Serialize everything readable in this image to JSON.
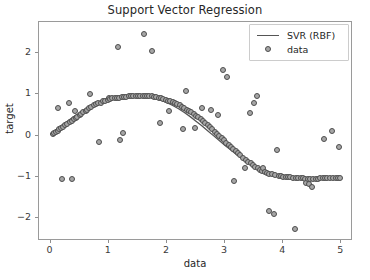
{
  "chart_data": {
    "type": "scatter",
    "title": "Support Vector Regression",
    "xlabel": "data",
    "ylabel": "target",
    "xlim": [
      -0.2,
      5.2
    ],
    "ylim": [
      -2.55,
      2.75
    ],
    "xticks": [
      0,
      1,
      2,
      3,
      4,
      5
    ],
    "yticks": [
      -2,
      -1,
      0,
      1,
      2
    ],
    "xtick_labels": [
      "0",
      "1",
      "2",
      "3",
      "4",
      "5"
    ],
    "ytick_labels": [
      "−2",
      "−1",
      "0",
      "1",
      "2"
    ],
    "grid": false,
    "legend_position": "upper right",
    "legend": [
      {
        "label": "SVR (RBF)",
        "key": "line",
        "color": "#555555"
      },
      {
        "label": "data",
        "key": "marker",
        "color": "#a6a6a6"
      }
    ],
    "series": [
      {
        "name": "SVR (RBF)",
        "type": "line",
        "color": "#555555",
        "comment": "smooth regression curve approximating sin(x) over [0,5]",
        "x": [
          0.0,
          0.1,
          0.2,
          0.3,
          0.4,
          0.5,
          0.6,
          0.7,
          0.8,
          0.9,
          1.0,
          1.1,
          1.2,
          1.3,
          1.4,
          1.5,
          1.6,
          1.7,
          1.8,
          1.9,
          2.0,
          2.1,
          2.2,
          2.3,
          2.4,
          2.5,
          2.6,
          2.7,
          2.8,
          2.9,
          3.0,
          3.1,
          3.2,
          3.3,
          3.4,
          3.5,
          3.6,
          3.7,
          3.8,
          3.9,
          4.0,
          4.1,
          4.2,
          4.3,
          4.4,
          4.5,
          4.6,
          4.7,
          4.8,
          4.9,
          5.0
        ],
        "y": [
          0.04,
          0.15,
          0.26,
          0.36,
          0.46,
          0.55,
          0.64,
          0.72,
          0.79,
          0.85,
          0.89,
          0.93,
          0.95,
          0.97,
          0.97,
          0.97,
          0.96,
          0.94,
          0.9,
          0.86,
          0.8,
          0.73,
          0.65,
          0.56,
          0.46,
          0.35,
          0.24,
          0.12,
          0.0,
          -0.12,
          -0.24,
          -0.35,
          -0.46,
          -0.56,
          -0.65,
          -0.73,
          -0.8,
          -0.86,
          -0.9,
          -0.94,
          -0.96,
          -0.98,
          -0.99,
          -1.0,
          -1.01,
          -1.02,
          -1.02,
          -1.02,
          -1.02,
          -1.02,
          -1.02
        ]
      },
      {
        "name": "data",
        "type": "scatter",
        "marker": "circle",
        "facecolor": "#a6a6a6",
        "edgecolor": "#4d4d4d",
        "points": [
          [
            0.04,
            0.04
          ],
          [
            0.06,
            0.06
          ],
          [
            0.09,
            0.09
          ],
          [
            0.12,
            0.12
          ],
          [
            0.15,
            0.15
          ],
          [
            0.18,
            0.18
          ],
          [
            0.2,
            -1.05
          ],
          [
            0.22,
            0.22
          ],
          [
            0.25,
            0.25
          ],
          [
            0.28,
            0.28
          ],
          [
            0.12,
            0.67
          ],
          [
            0.32,
            0.78
          ],
          [
            0.33,
            0.33
          ],
          [
            0.36,
            0.36
          ],
          [
            0.37,
            -1.04
          ],
          [
            0.4,
            0.4
          ],
          [
            0.42,
            0.6
          ],
          [
            0.43,
            0.43
          ],
          [
            0.46,
            0.46
          ],
          [
            0.5,
            0.5
          ],
          [
            0.53,
            0.53
          ],
          [
            0.56,
            0.56
          ],
          [
            0.6,
            0.6
          ],
          [
            0.63,
            0.63
          ],
          [
            0.66,
            0.66
          ],
          [
            0.68,
            1.01
          ],
          [
            0.7,
            0.7
          ],
          [
            0.74,
            0.73
          ],
          [
            0.78,
            0.76
          ],
          [
            0.82,
            0.78
          ],
          [
            0.84,
            -0.15
          ],
          [
            0.86,
            0.8
          ],
          [
            0.9,
            0.83
          ],
          [
            0.94,
            0.85
          ],
          [
            0.98,
            0.87
          ],
          [
            1.0,
            0.92
          ],
          [
            1.02,
            0.88
          ],
          [
            1.06,
            0.9
          ],
          [
            1.1,
            0.9
          ],
          [
            1.14,
            0.91
          ],
          [
            1.15,
            2.15
          ],
          [
            1.18,
            0.92
          ],
          [
            1.2,
            -0.1
          ],
          [
            1.22,
            0.93
          ],
          [
            1.24,
            0.07
          ],
          [
            1.26,
            0.93
          ],
          [
            1.3,
            0.94
          ],
          [
            1.34,
            0.95
          ],
          [
            1.38,
            0.95
          ],
          [
            1.42,
            0.96
          ],
          [
            1.46,
            0.96
          ],
          [
            1.5,
            0.97
          ],
          [
            1.54,
            0.97
          ],
          [
            1.58,
            0.97
          ],
          [
            1.6,
            2.45
          ],
          [
            1.62,
            0.96
          ],
          [
            1.66,
            0.96
          ],
          [
            1.7,
            0.95
          ],
          [
            1.74,
            0.95
          ],
          [
            1.75,
            2.05
          ],
          [
            1.78,
            0.94
          ],
          [
            1.82,
            0.93
          ],
          [
            1.86,
            0.92
          ],
          [
            1.88,
            0.3
          ],
          [
            1.9,
            0.9
          ],
          [
            1.94,
            0.89
          ],
          [
            1.98,
            0.87
          ],
          [
            2.02,
            0.85
          ],
          [
            2.04,
            0.6
          ],
          [
            2.06,
            0.83
          ],
          [
            2.1,
            0.81
          ],
          [
            2.14,
            0.78
          ],
          [
            2.18,
            0.76
          ],
          [
            2.22,
            0.73
          ],
          [
            2.26,
            0.7
          ],
          [
            2.28,
            0.15
          ],
          [
            2.3,
            0.67
          ],
          [
            2.32,
            1.08
          ],
          [
            2.34,
            0.63
          ],
          [
            2.38,
            0.6
          ],
          [
            2.42,
            0.56
          ],
          [
            2.46,
            0.52
          ],
          [
            2.48,
            0.19
          ],
          [
            2.5,
            0.48
          ],
          [
            2.54,
            0.44
          ],
          [
            2.58,
            0.4
          ],
          [
            2.6,
            0.68
          ],
          [
            2.62,
            0.35
          ],
          [
            2.66,
            0.3
          ],
          [
            2.7,
            0.25
          ],
          [
            2.74,
            0.2
          ],
          [
            2.76,
            0.63
          ],
          [
            2.78,
            0.15
          ],
          [
            2.82,
            0.1
          ],
          [
            2.86,
            0.05
          ],
          [
            2.88,
            0.5
          ],
          [
            2.9,
            0.0
          ],
          [
            2.94,
            -0.06
          ],
          [
            2.96,
            1.58
          ],
          [
            2.98,
            -0.11
          ],
          [
            3.02,
            -0.17
          ],
          [
            3.04,
            1.41
          ],
          [
            3.06,
            -0.22
          ],
          [
            3.1,
            -0.28
          ],
          [
            3.14,
            -0.33
          ],
          [
            3.16,
            -1.1
          ],
          [
            3.18,
            -0.38
          ],
          [
            3.22,
            -0.43
          ],
          [
            3.26,
            -0.48
          ],
          [
            3.3,
            -0.53
          ],
          [
            3.34,
            -0.79
          ],
          [
            3.36,
            -0.58
          ],
          [
            3.4,
            -0.63
          ],
          [
            3.42,
            0.55
          ],
          [
            3.44,
            -0.67
          ],
          [
            3.48,
            -0.71
          ],
          [
            3.5,
            0.8
          ],
          [
            3.52,
            -0.75
          ],
          [
            3.55,
            0.96
          ],
          [
            3.56,
            -0.79
          ],
          [
            3.6,
            -0.82
          ],
          [
            3.64,
            -0.85
          ],
          [
            3.66,
            -0.79
          ],
          [
            3.68,
            -0.88
          ],
          [
            3.72,
            -0.9
          ],
          [
            3.75,
            -1.83
          ],
          [
            3.76,
            -0.92
          ],
          [
            3.8,
            -0.94
          ],
          [
            3.84,
            -1.9
          ],
          [
            3.86,
            -0.96
          ],
          [
            3.9,
            -0.35
          ],
          [
            3.92,
            -0.97
          ],
          [
            3.96,
            -0.98
          ],
          [
            4.0,
            -0.99
          ],
          [
            4.04,
            -1.0
          ],
          [
            4.08,
            -1.01
          ],
          [
            4.12,
            -1.01
          ],
          [
            4.16,
            -1.02
          ],
          [
            4.2,
            -2.25
          ],
          [
            4.22,
            -1.02
          ],
          [
            4.26,
            -1.03
          ],
          [
            4.3,
            -1.03
          ],
          [
            4.34,
            -1.03
          ],
          [
            4.38,
            -1.04
          ],
          [
            4.4,
            -1.14
          ],
          [
            4.42,
            -1.04
          ],
          [
            4.45,
            -1.18
          ],
          [
            4.46,
            -1.04
          ],
          [
            4.5,
            -1.25
          ],
          [
            4.52,
            -1.04
          ],
          [
            4.56,
            -1.04
          ],
          [
            4.6,
            -1.04
          ],
          [
            4.64,
            -1.03
          ],
          [
            4.68,
            -1.03
          ],
          [
            4.7,
            -0.08
          ],
          [
            4.72,
            -1.03
          ],
          [
            4.76,
            -1.03
          ],
          [
            4.8,
            -1.02
          ],
          [
            4.84,
            0.12
          ],
          [
            4.86,
            -1.02
          ],
          [
            4.9,
            -1.02
          ],
          [
            4.94,
            -1.02
          ],
          [
            4.96,
            -0.28
          ],
          [
            4.98,
            -1.02
          ]
        ]
      }
    ]
  }
}
